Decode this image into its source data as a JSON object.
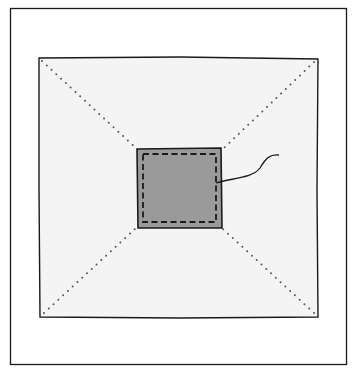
{
  "figure": {
    "colors": {
      "outline": "#1a1a1a",
      "block_fill": "#f4f4f4",
      "patch_fill": "#9a9a9a",
      "dots": "#555555"
    },
    "elements": [
      {
        "name": "outer-frame",
        "x": 10,
        "y": 8,
        "w": 336,
        "h": 356
      },
      {
        "name": "fabric-block",
        "x": 39,
        "y": 58,
        "w": 279,
        "h": 259
      },
      {
        "name": "center-patch",
        "x": 137,
        "y": 149,
        "w": 85,
        "h": 79
      },
      {
        "name": "basting-stitch",
        "style": "dashed"
      },
      {
        "name": "diagonal-fold-lines",
        "count": 4,
        "style": "dotted"
      },
      {
        "name": "loose-thread"
      }
    ]
  }
}
